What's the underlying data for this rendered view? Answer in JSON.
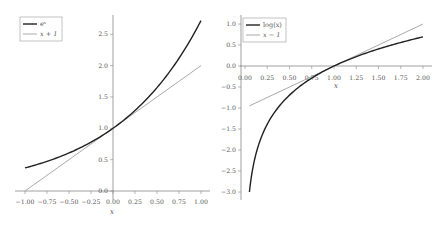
{
  "chart_data": [
    {
      "type": "line",
      "title": "",
      "xlabel": "x",
      "ylabel": "",
      "xlim": [
        -1.0,
        1.0
      ],
      "ylim": [
        0.0,
        2.7
      ],
      "grid": false,
      "legend_position": "upper left",
      "x_ticks": [
        "-1.00",
        "-0.75",
        "-0.50",
        "-0.25",
        "0.00",
        "0.25",
        "0.50",
        "0.75",
        "1.00"
      ],
      "y_ticks": [
        "0.0",
        "0.5",
        "1.0",
        "1.5",
        "2.0",
        "2.5"
      ],
      "x": [
        -1.0,
        -0.75,
        -0.5,
        -0.25,
        0.0,
        0.25,
        0.5,
        0.75,
        1.0
      ],
      "series": [
        {
          "name": "e^x",
          "color": "#222222",
          "values": [
            0.368,
            0.472,
            0.607,
            0.779,
            1.0,
            1.284,
            1.649,
            2.117,
            2.718
          ]
        },
        {
          "name": "x+1",
          "color": "#aaaaaa",
          "values": [
            0.0,
            0.25,
            0.5,
            0.75,
            1.0,
            1.25,
            1.5,
            1.75,
            2.0
          ]
        }
      ]
    },
    {
      "type": "line",
      "title": "",
      "xlabel": "x",
      "ylabel": "",
      "xlim": [
        0.0,
        2.0
      ],
      "ylim": [
        -3.0,
        1.0
      ],
      "grid": false,
      "legend_position": "upper left",
      "x_ticks": [
        "0.00",
        "0.25",
        "0.50",
        "0.75",
        "1.00",
        "1.25",
        "1.50",
        "1.75",
        "2.00"
      ],
      "y_ticks": [
        "-3.0",
        "-2.5",
        "-2.0",
        "-1.5",
        "-1.0",
        "-0.5",
        "0.0",
        "0.5",
        "1.0"
      ],
      "x": [
        0.05,
        0.25,
        0.5,
        0.75,
        1.0,
        1.25,
        1.5,
        1.75,
        2.0
      ],
      "series": [
        {
          "name": "log(x)",
          "color": "#222222",
          "values": [
            -3.0,
            -1.386,
            -0.693,
            -0.288,
            0.0,
            0.223,
            0.405,
            0.56,
            0.693
          ]
        },
        {
          "name": "x-1",
          "color": "#aaaaaa",
          "values": [
            -0.95,
            -0.75,
            -0.5,
            -0.25,
            0.0,
            0.25,
            0.5,
            0.75,
            1.0
          ]
        }
      ]
    }
  ],
  "left": {
    "legend": [
      "eˣ",
      "x + 1"
    ],
    "xlabel": "x",
    "xticks": [
      "−1.00",
      "−0.75",
      "−0.50",
      "−0.25",
      "0.00",
      "0.25",
      "0.50",
      "0.75",
      "1.00"
    ],
    "yticks": [
      "0.0",
      "0.5",
      "1.0",
      "1.5",
      "2.0",
      "2.5"
    ]
  },
  "right": {
    "legend": [
      "log(x)",
      "x − 1"
    ],
    "xlabel": "x",
    "xticks": [
      "0.00",
      "0.25",
      "0.50",
      "0.75",
      "1.00",
      "1.25",
      "1.50",
      "1.75",
      "2.00"
    ],
    "yticks": [
      "−3.0",
      "−2.5",
      "−2.0",
      "−1.5",
      "−1.0",
      "−0.5",
      "0.0",
      "0.5",
      "1.0"
    ]
  }
}
